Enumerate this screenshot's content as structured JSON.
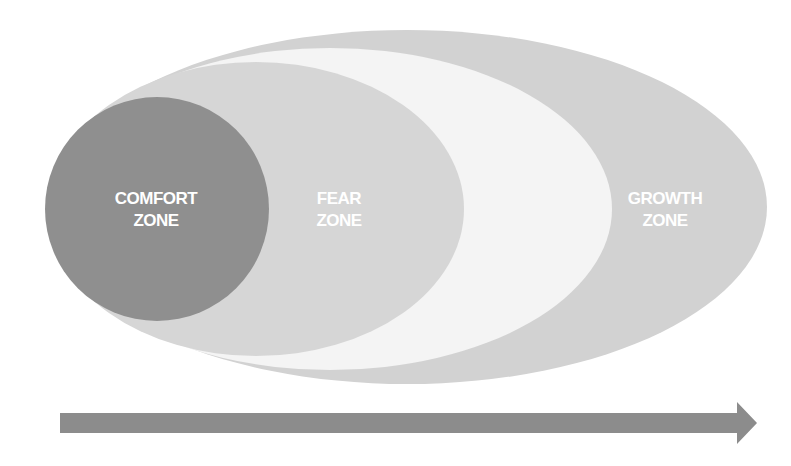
{
  "diagram": {
    "zones": [
      {
        "id": "comfort",
        "line1": "COMFORT",
        "line2": "ZONE",
        "color": "#8f8f8f"
      },
      {
        "id": "fear",
        "line1": "FEAR",
        "line2": "ZONE",
        "color": "#d6d6d6"
      },
      {
        "id": "learning",
        "line1": "",
        "line2": "",
        "color": "#f4f4f4"
      },
      {
        "id": "growth",
        "line1": "GROWTH",
        "line2": "ZONE",
        "color": "#d2d2d2"
      }
    ],
    "arrow": {
      "color": "#8c8c8c",
      "direction": "right"
    }
  }
}
